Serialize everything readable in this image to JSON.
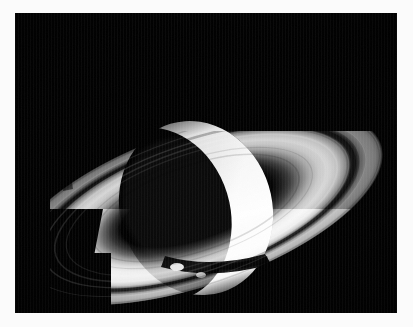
{
  "image": {
    "kind": "photograph",
    "subject": "Saturn",
    "view": "backlit crescent, rings nearly edge-on tilt",
    "palette": "grayscale",
    "frame": {
      "mat_color": "#fbfbfb",
      "photo_background": "#000000",
      "photo_x": 15,
      "photo_y": 13,
      "photo_width": 382,
      "photo_height": 300
    },
    "colors": {
      "space_black": "#000000",
      "ring_a_outer": "#6e6e6e",
      "ring_a_mid": "#8a8a8a",
      "cassini_division": "#121212",
      "ring_b_bright": "#cfcfcf",
      "ring_b_peak": "#e8e8e8",
      "ring_c_faint": "#3a3a3a",
      "planet_night_side": "#060606",
      "planet_terminator": "#2a2a2a",
      "crescent_white": "#ffffff",
      "crescent_warm_white": "#f6f6f6",
      "ring_shadow": "#050505"
    },
    "geometry": {
      "planet_center_x": 196,
      "planet_center_y": 208,
      "planet_radius_x": 74,
      "planet_radius_y": 86,
      "ring_center_x": 196,
      "ring_center_y": 208,
      "ring_outer_rx": 196,
      "ring_outer_ry": 78,
      "ring_rotation_deg": -19,
      "crescent_side": "right",
      "shadow_cutoff_left_x": 50
    }
  },
  "annotations": {
    "title": "Saturn",
    "description": "Backlit view of Saturn showing a bright crescent limb and the ring system with the Cassini Division"
  }
}
